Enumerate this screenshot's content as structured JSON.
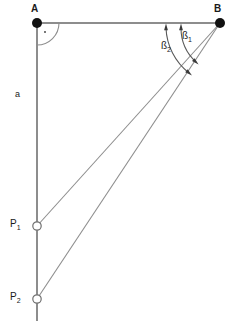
{
  "figure": {
    "type": "geometry-diagram",
    "background_color": "#ffffff",
    "line_color": "#8d8d8d",
    "marker_fill_color": "#111111",
    "text_color": "#1a1a1a"
  },
  "vertices": [
    {
      "id": "A",
      "label": "A",
      "marker": "filled-dot",
      "x": 37,
      "y": 23,
      "label_x": 33,
      "label_y": 6
    },
    {
      "id": "B",
      "label": "B",
      "marker": "filled-dot",
      "x": 220,
      "y": 23,
      "label_x": 216,
      "label_y": 6
    }
  ],
  "points": [
    {
      "id": "P1",
      "label": "P",
      "subscript": "1",
      "marker": "open-circle",
      "x": 37,
      "y": 226,
      "label_x": 12,
      "label_y": 220
    },
    {
      "id": "P2",
      "label": "P",
      "subscript": "2",
      "marker": "open-circle",
      "x": 37,
      "y": 299,
      "label_x": 12,
      "label_y": 293
    }
  ],
  "segments": [
    {
      "id": "baseline-AB",
      "name": "baseline A to B",
      "from": "A",
      "to": "B",
      "x1": 37,
      "y1": 23,
      "x2": 220,
      "y2": 23
    },
    {
      "id": "perpendicular-A-down",
      "name": "perpendicular line from A downward",
      "from": "A",
      "to": "line-end",
      "x1": 37,
      "y1": 23,
      "x2": 37,
      "y2": 321
    },
    {
      "id": "sightline-B-P1",
      "name": "sight line B to P1",
      "from": "B",
      "to": "P1",
      "x1": 220,
      "y1": 23,
      "x2": 37,
      "y2": 226
    },
    {
      "id": "sightline-B-P2",
      "name": "sight line B to P2",
      "from": "B",
      "to": "P2",
      "x1": 220,
      "y1": 23,
      "x2": 37,
      "y2": 299
    }
  ],
  "side_labels": [
    {
      "id": "a",
      "label": "a",
      "meaning": "distance along perpendicular from A",
      "x": 16,
      "y": 92
    }
  ],
  "angles": [
    {
      "id": "beta1",
      "label": "ß",
      "subscript": "1",
      "vertex": "B",
      "between": [
        "baseline-BA",
        "sightline-B-P1"
      ],
      "arc_radius": 55,
      "label_x": 184,
      "label_y": 33,
      "arrow_heads": "both"
    },
    {
      "id": "beta2",
      "label": "ß",
      "subscript": "2",
      "vertex": "B",
      "between": [
        "baseline-BA",
        "sightline-B-P2"
      ],
      "arc_radius": 70,
      "label_x": 163,
      "label_y": 43,
      "arrow_heads": "both"
    }
  ],
  "right_angle": {
    "id": "right-angle-A",
    "vertex": "A",
    "symbol": "quarter-arc-with-dot",
    "value_degrees": 90,
    "arc_radius": 22,
    "dot_x": 45,
    "dot_y": 32
  }
}
